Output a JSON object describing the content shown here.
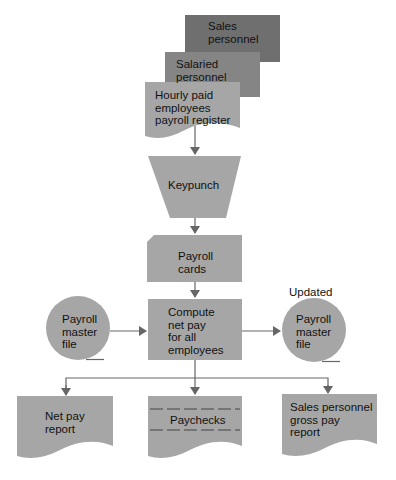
{
  "colors": {
    "sales_personnel_fill": "#6f6f6f",
    "salaried_fill": "#858585",
    "shape_fill": "#a6a6a6",
    "line": "#666666",
    "text": "#111111",
    "background": "#ffffff"
  },
  "nodes": {
    "sales_personnel": {
      "line1": "Sales",
      "line2": "personnel"
    },
    "salaried_personnel": {
      "line1": "Salaried",
      "line2": "personnel"
    },
    "hourly_register": {
      "line1": "Hourly paid",
      "line2": "employees",
      "line3": "payroll register"
    },
    "keypunch": {
      "label": "Keypunch"
    },
    "payroll_cards": {
      "line1": "Payroll",
      "line2": "cards"
    },
    "compute": {
      "line1": "Compute",
      "line2": "net pay",
      "line3": "for all",
      "line4": "employees"
    },
    "master_file_in": {
      "line1": "Payroll",
      "line2": "master",
      "line3": "file"
    },
    "master_file_out": {
      "caption": "Updated",
      "line1": "Payroll",
      "line2": "master",
      "line3": "file"
    },
    "net_pay_report": {
      "line1": "Net pay",
      "line2": "report"
    },
    "paychecks": {
      "label": "Paychecks"
    },
    "sales_gross_report": {
      "line1": "Sales personnel",
      "line2": "gross pay",
      "line3": "report"
    }
  }
}
